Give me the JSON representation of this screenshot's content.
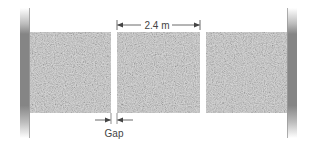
{
  "diagram": {
    "dimension_label": "2.4 m",
    "gap_label": "Gap",
    "slab_count": 3,
    "colors": {
      "slab": "#d2d2d2",
      "slab_speckle_dark": "#b8b8b8",
      "slab_speckle_light": "#ebebeb",
      "wall_dark": "#7d7d7d",
      "wall_light": "#c8c8c8",
      "line": "#444444"
    }
  }
}
